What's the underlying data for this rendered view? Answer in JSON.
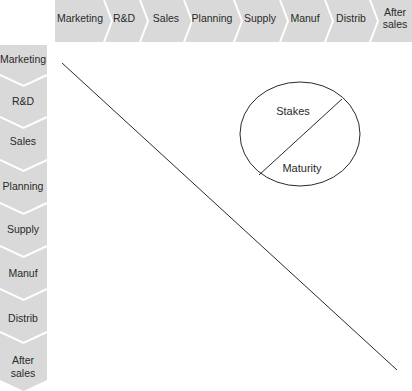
{
  "colors": {
    "band_fill": "#d9d9d9",
    "separator": "#ffffff",
    "line": "#2a2a2a"
  },
  "header": {
    "items": [
      {
        "label": "Marketing"
      },
      {
        "label": "R&D"
      },
      {
        "label": "Sales"
      },
      {
        "label": "Planning"
      },
      {
        "label": "Supply"
      },
      {
        "label": "Manuf"
      },
      {
        "label": "Distrib"
      },
      {
        "label": "After",
        "label2": "sales"
      }
    ]
  },
  "sidebar": {
    "items": [
      {
        "label": "Marketing"
      },
      {
        "label": "R&D"
      },
      {
        "label": "Sales"
      },
      {
        "label": "Planning"
      },
      {
        "label": "Supply"
      },
      {
        "label": "Manuf"
      },
      {
        "label": "Distrib"
      },
      {
        "label": "After",
        "label2": "sales"
      }
    ]
  },
  "legend_circle": {
    "top_label": "Stakes",
    "bottom_label": "Maturity"
  }
}
